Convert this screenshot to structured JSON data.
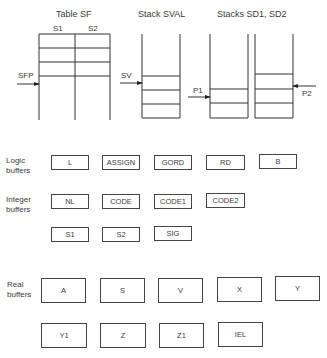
{
  "diagram": {
    "structures": {
      "table_sf": {
        "title": "Table SF",
        "columns": [
          "S1",
          "S2"
        ],
        "pointer": "SFP"
      },
      "stack_sval": {
        "title": "Stack SVAL",
        "pointer": "SV"
      },
      "stacks_sd": {
        "title": "Stacks SD1, SD2",
        "pointers": [
          "P1",
          "P2"
        ]
      }
    },
    "buffer_groups": [
      {
        "label_line1": "Logic",
        "label_line2": "buffers",
        "rows": [
          [
            "L",
            "ASSIGN",
            "GORD",
            "RD",
            "B"
          ]
        ]
      },
      {
        "label_line1": "Integer",
        "label_line2": "buffers",
        "rows": [
          [
            "NL",
            "CODE",
            "CODE1",
            "CODE2"
          ],
          [
            "S1",
            "S2",
            "SIG"
          ]
        ]
      },
      {
        "label_line1": "Real",
        "label_line2": "buffers",
        "rows": [
          [
            "A",
            "S",
            "V",
            "X",
            "Y"
          ],
          [
            "Y1",
            "Z",
            "Z1",
            "IEL"
          ]
        ]
      }
    ]
  }
}
